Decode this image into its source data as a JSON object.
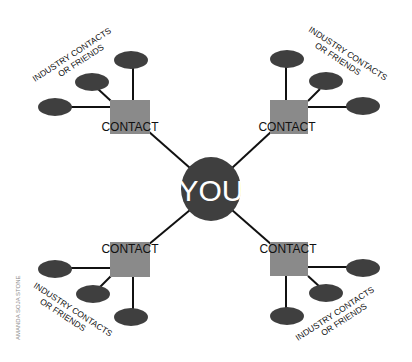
{
  "center": {
    "label": "YOU"
  },
  "contact_label": "CONTACT",
  "group_label_line1": "INDUSTRY CONTACTS",
  "group_label_line2": "OR FRIENDS",
  "credit": "AMANDA SOJA STONE",
  "colors": {
    "node_dark": "#3f3f3f",
    "contact_box": "#8a8a8a",
    "line": "#111111",
    "text": "#111111",
    "center_text": "#ffffff",
    "credit_text": "#8a8a8a"
  },
  "groups": [
    {
      "position": "top-left",
      "contact": "CONTACT",
      "friends_count": 3,
      "label": [
        "INDUSTRY CONTACTS",
        "OR FRIENDS"
      ]
    },
    {
      "position": "top-right",
      "contact": "CONTACT",
      "friends_count": 3,
      "label": [
        "INDUSTRY CONTACTS",
        "OR FRIENDS"
      ]
    },
    {
      "position": "bottom-left",
      "contact": "CONTACT",
      "friends_count": 3,
      "label": [
        "INDUSTRY CONTACTS",
        "OR FRIENDS"
      ]
    },
    {
      "position": "bottom-right",
      "contact": "CONTACT",
      "friends_count": 3,
      "label": [
        "INDUSTRY CONTACTS",
        "OR FRIENDS"
      ]
    }
  ]
}
